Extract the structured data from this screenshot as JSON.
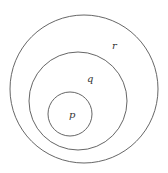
{
  "diagram": {
    "type": "nested-venn",
    "stroke_color": "#555555",
    "background": "#ffffff",
    "sets": [
      {
        "name": "r",
        "label": "r",
        "cx": 84,
        "cy": 89,
        "r": 74,
        "label_x": 112,
        "label_y": 49
      },
      {
        "name": "q",
        "label": "q",
        "cx": 78,
        "cy": 101,
        "r": 49,
        "label_x": 87,
        "label_y": 82
      },
      {
        "name": "p",
        "label": "p",
        "cx": 70,
        "cy": 114,
        "r": 22,
        "label_x": 69,
        "label_y": 118
      }
    ]
  }
}
